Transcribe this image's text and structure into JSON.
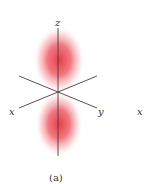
{
  "figure": {
    "caption": "(a)",
    "orbital": "p_z",
    "lobe_color": "#e8323f",
    "axis_color": "#4a3a40",
    "axes": {
      "z_label": "z",
      "x_label": "x",
      "y_label": "y"
    },
    "neighbor_partial_label": "x"
  }
}
